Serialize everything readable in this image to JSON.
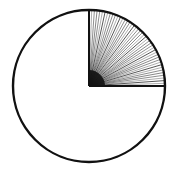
{
  "chart_data": {
    "type": "pie",
    "title": "",
    "categories": [
      "Shaded sector",
      "Unshaded remainder"
    ],
    "values": [
      25,
      75
    ],
    "unit": "percent",
    "start_angle": "12 o'clock",
    "direction": "clockwise",
    "legend": null,
    "annotations": [],
    "styles": {
      "outline_color": "#111111",
      "shaded_fill": "radial-hatch",
      "unshaded_fill": "#ffffff"
    }
  },
  "geometry": {
    "cx": 89,
    "cy": 86,
    "r": 76,
    "hatch_lines": 44
  }
}
